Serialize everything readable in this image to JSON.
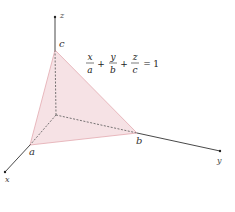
{
  "diagram": {
    "type": "3d-plane-intercepts",
    "axes": {
      "x_label": "x",
      "y_label": "y",
      "z_label": "z"
    },
    "intercepts": {
      "a_label": "a",
      "b_label": "b",
      "c_label": "c"
    },
    "equation": {
      "terms": [
        {
          "num": "x",
          "den": "a"
        },
        {
          "num": "y",
          "den": "b"
        },
        {
          "num": "z",
          "den": "c"
        }
      ],
      "plus": "+",
      "equals": "=",
      "rhs": "1"
    },
    "colors": {
      "plane_fill": "#f5dde0",
      "plane_edge": "#e3a9b0",
      "axis": "#333333",
      "dashed": "#555555"
    }
  }
}
